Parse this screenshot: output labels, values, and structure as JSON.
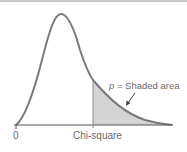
{
  "figure": {
    "type": "chi-square distribution diagram",
    "axis": {
      "origin_label": "0",
      "critical_label": "Chi-square"
    },
    "annotation": {
      "variable": "p",
      "text": " = Shaded area"
    },
    "colors": {
      "curve": "#7a7a7a",
      "shaded_area": "#d4d4d4",
      "axis": "#555555",
      "text": "#6a6a6a"
    }
  }
}
